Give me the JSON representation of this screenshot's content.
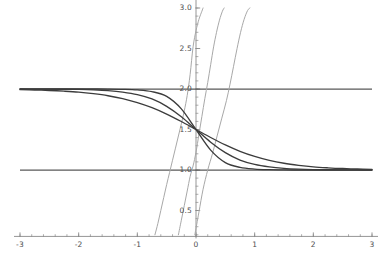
{
  "chart_data": {
    "type": "line",
    "title": "",
    "subtitle": "",
    "xlabel": "",
    "ylabel": "",
    "xlim": [
      -3,
      3
    ],
    "ylim": [
      0.18,
      3.05
    ],
    "grid": false,
    "legend": null,
    "axes": {
      "x_axis_y_value": 0.18,
      "y_axis_x_value": 0,
      "x_tick_labels": [
        "-3",
        "-2",
        "-1",
        "0",
        "1",
        "2",
        "3"
      ],
      "x_tick_values": [
        -3,
        -2,
        -1,
        0,
        1,
        2,
        3
      ],
      "x_minor_step": 0.2,
      "y_tick_labels": [
        "0.5",
        "1.0",
        "1.5",
        "2.0",
        "2.5",
        "3.0"
      ],
      "y_tick_values": [
        0.5,
        1.0,
        1.5,
        2.0,
        2.5,
        3.0
      ],
      "y_minor_step": 0.1
    },
    "colors": {
      "dark_curve": "#3c3c3c",
      "light_curve": "#a8a8a8",
      "asymptote": "#585858",
      "axis": "#8a8a8a",
      "tick_text": "#4d4d4d",
      "background": "#ffffff"
    },
    "asymptotes": [
      {
        "name": "upper-asymptote",
        "y": 2.0,
        "style": "solid",
        "color": "#585858"
      },
      {
        "name": "lower-asymptote",
        "y": 1.0,
        "style": "solid",
        "color": "#585858"
      }
    ],
    "series": [
      {
        "name": "decreasing-sigmoid-k1",
        "group": "dark",
        "color": "#3c3c3c",
        "family": "y = 1 + 1/(1+e^(k x))",
        "k": 1.6,
        "shape": "decreasing sigmoid from y=2 to y=1",
        "x": [
          -3,
          -2.75,
          -2.5,
          -2.25,
          -2,
          -1.75,
          -1.5,
          -1.25,
          -1,
          -0.75,
          -0.5,
          -0.25,
          0,
          0.25,
          0.5,
          0.75,
          1,
          1.25,
          1.5,
          1.75,
          2,
          2.25,
          2.5,
          2.75,
          3
        ],
        "y": [
          1.992,
          1.988,
          1.982,
          1.973,
          1.961,
          1.942,
          1.917,
          1.881,
          1.832,
          1.769,
          1.69,
          1.599,
          1.5,
          1.401,
          1.31,
          1.231,
          1.168,
          1.119,
          1.083,
          1.058,
          1.039,
          1.027,
          1.018,
          1.012,
          1.008
        ]
      },
      {
        "name": "decreasing-sigmoid-k2",
        "group": "dark",
        "color": "#3c3c3c",
        "family": "y = 1 + 1/(1+e^(k x))",
        "k": 2.6,
        "shape": "decreasing sigmoid from y=2 to y=1",
        "x": [
          -3,
          -2.75,
          -2.5,
          -2.25,
          -2,
          -1.75,
          -1.5,
          -1.25,
          -1,
          -0.75,
          -0.5,
          -0.25,
          0,
          0.25,
          0.5,
          0.75,
          1,
          1.25,
          1.5,
          1.75,
          2,
          2.25,
          2.5,
          2.75,
          3
        ],
        "y": [
          1.9996,
          1.9992,
          1.9985,
          1.9971,
          1.9945,
          1.9894,
          1.9798,
          1.9619,
          1.9309,
          1.877,
          1.7858,
          1.6572,
          1.5,
          1.3428,
          1.2142,
          1.123,
          1.0691,
          1.0381,
          1.0202,
          1.0106,
          1.0055,
          1.0029,
          1.0015,
          1.0008,
          1.0004
        ]
      },
      {
        "name": "decreasing-sigmoid-k3",
        "group": "dark",
        "color": "#3c3c3c",
        "family": "y = 1 + 1/(1+e^(k x))",
        "k": 4.5,
        "shape": "steep decreasing sigmoid from y=2 to y=1",
        "x": [
          -3,
          -2.75,
          -2.5,
          -2.25,
          -2,
          -1.75,
          -1.5,
          -1.25,
          -1,
          -0.75,
          -0.5,
          -0.25,
          0,
          0.25,
          0.5,
          0.75,
          1,
          1.25,
          1.5,
          1.75,
          2,
          2.25,
          2.5,
          2.75,
          3
        ],
        "y": [
          2.0,
          2.0,
          2.0,
          1.9999,
          1.9999,
          1.9996,
          1.9988,
          1.9963,
          1.989,
          1.9677,
          1.9089,
          1.7551,
          1.5,
          1.2449,
          1.0911,
          1.0323,
          1.011,
          1.0037,
          1.0012,
          1.0004,
          1.0001,
          1.0001,
          1.0,
          1.0,
          1.0
        ]
      },
      {
        "name": "steep-rising-curve-a",
        "group": "light",
        "color": "#a8a8a8",
        "family": "steep rising curve crossing y=2 near x=0",
        "shape": "near-vertical rising curve through origin region",
        "x_crossing_low": -0.7,
        "x_crossing_high": 0.12,
        "x": [
          -0.7,
          -0.65,
          -0.6,
          -0.55,
          -0.5,
          -0.45,
          -0.4,
          -0.35,
          -0.3,
          -0.25,
          -0.2,
          -0.15,
          -0.1,
          -0.05,
          0.0,
          0.05,
          0.1,
          0.12
        ],
        "y": [
          0.2,
          0.34,
          0.5,
          0.66,
          0.82,
          0.97,
          1.12,
          1.27,
          1.42,
          1.57,
          1.73,
          1.92,
          2.18,
          2.52,
          2.72,
          2.86,
          2.96,
          3.0
        ]
      },
      {
        "name": "steep-rising-curve-b",
        "group": "light",
        "color": "#a8a8a8",
        "family": "steep rising curve crossing y=2 near x=0.2",
        "shape": "near-vertical rising curve shifted right",
        "x_crossing_low": -0.3,
        "x_crossing_high": 0.48,
        "x": [
          -0.3,
          -0.25,
          -0.2,
          -0.15,
          -0.1,
          -0.05,
          0.0,
          0.05,
          0.1,
          0.15,
          0.2,
          0.25,
          0.3,
          0.35,
          0.4,
          0.45,
          0.48
        ],
        "y": [
          0.2,
          0.38,
          0.56,
          0.74,
          0.92,
          1.05,
          1.22,
          1.44,
          1.66,
          1.88,
          2.08,
          2.3,
          2.52,
          2.7,
          2.85,
          2.96,
          3.0
        ]
      },
      {
        "name": "steep-rising-curve-c",
        "group": "light",
        "color": "#a8a8a8",
        "family": "steep rising curve crossing y=2 near x=0.5",
        "shape": "wider rising curve shifted further right",
        "x_crossing_low": -0.02,
        "x_crossing_high": 0.92,
        "x": [
          -0.02,
          0.05,
          0.12,
          0.2,
          0.28,
          0.36,
          0.44,
          0.52,
          0.58,
          0.64,
          0.7,
          0.76,
          0.82,
          0.88,
          0.92
        ],
        "y": [
          0.2,
          0.48,
          0.76,
          1.0,
          1.2,
          1.42,
          1.64,
          1.86,
          2.06,
          2.28,
          2.5,
          2.7,
          2.86,
          2.97,
          3.0
        ]
      }
    ]
  },
  "axis_labels": {
    "x": [
      {
        "text": "-3",
        "value": -3
      },
      {
        "text": "-2",
        "value": -2
      },
      {
        "text": "-1",
        "value": -1
      },
      {
        "text": "0",
        "value": 0
      },
      {
        "text": "1",
        "value": 1
      },
      {
        "text": "2",
        "value": 2
      },
      {
        "text": "3",
        "value": 3
      }
    ],
    "y": [
      {
        "text": "0.5",
        "value": 0.5
      },
      {
        "text": "1.0",
        "value": 1.0
      },
      {
        "text": "1.5",
        "value": 1.5
      },
      {
        "text": "2.0",
        "value": 2.0
      },
      {
        "text": "2.5",
        "value": 2.5
      },
      {
        "text": "3.0",
        "value": 3.0
      }
    ]
  }
}
